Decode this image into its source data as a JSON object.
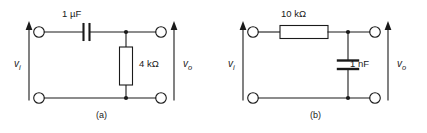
{
  "figure": {
    "background": "#ffffff",
    "line_color": "#1a1a1a",
    "fill_color": "#ffffff"
  },
  "circuits": [
    {
      "id": "a",
      "caption": "(a)",
      "type": "high-pass-rc",
      "series_component": {
        "kind": "capacitor",
        "orientation": "horizontal",
        "value": "1 µF"
      },
      "shunt_component": {
        "kind": "resistor",
        "orientation": "vertical",
        "value": "4 kΩ"
      },
      "input_port": {
        "label": "v",
        "subscript": "i",
        "arrow": "up"
      },
      "output_port": {
        "label": "v",
        "subscript": "o",
        "arrow": "up"
      }
    },
    {
      "id": "b",
      "caption": "(b)",
      "type": "low-pass-rc",
      "series_component": {
        "kind": "resistor",
        "orientation": "horizontal",
        "value": "10 kΩ"
      },
      "shunt_component": {
        "kind": "capacitor",
        "orientation": "vertical",
        "value": "1 nF"
      },
      "input_port": {
        "label": "v",
        "subscript": "i",
        "arrow": "up"
      },
      "output_port": {
        "label": "v",
        "subscript": "o",
        "arrow": "up"
      }
    }
  ]
}
